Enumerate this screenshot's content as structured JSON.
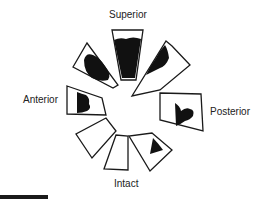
{
  "diagram": {
    "type": "radial-sector-diagram",
    "labels": {
      "superior": "Superior",
      "posterior": "Posterior",
      "intact": "Intact",
      "anterior": "Anterior"
    },
    "sectors": [
      {
        "id": "superior",
        "direction": "top",
        "filled": true,
        "fill_extent": "high"
      },
      {
        "id": "superior-posterior",
        "direction": "top-right",
        "filled": true,
        "fill_extent": "partial"
      },
      {
        "id": "posterior",
        "direction": "right",
        "filled": true,
        "fill_extent": "partial"
      },
      {
        "id": "posterior-inferior",
        "direction": "bottom-right",
        "filled": true,
        "fill_extent": "small"
      },
      {
        "id": "intact",
        "direction": "bottom",
        "filled": false,
        "fill_extent": "none"
      },
      {
        "id": "intact-left",
        "direction": "bottom-left",
        "filled": false,
        "fill_extent": "none"
      },
      {
        "id": "anterior",
        "direction": "left",
        "filled": true,
        "fill_extent": "partial"
      },
      {
        "id": "superior-anterior",
        "direction": "top-left",
        "filled": true,
        "fill_extent": "high"
      }
    ],
    "colors": {
      "outline": "#1a1a1a",
      "fill": "#111111",
      "background": "#ffffff"
    },
    "scale_bar": true
  }
}
